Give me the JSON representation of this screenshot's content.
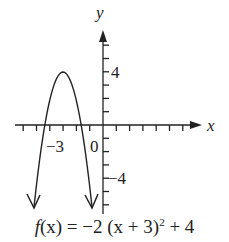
{
  "chart_data": {
    "type": "line",
    "function": "f(x) = -2(x+3)^2 + 4",
    "xlabel": "x",
    "ylabel": "y",
    "tick_labels": {
      "x": [
        "-3",
        "0"
      ],
      "y": [
        "4",
        "-4"
      ]
    },
    "xlim": [
      -7,
      7
    ],
    "ylim": [
      -6,
      7
    ],
    "vertex": [
      -3,
      4
    ],
    "roots": [
      -4.41,
      -1.59
    ],
    "opens": "down",
    "grid": false,
    "legend": null
  },
  "labels": {
    "x_axis": "x",
    "y_axis": "y",
    "tick_neg3": "−3",
    "tick_0": "0",
    "tick_4": "4",
    "tick_neg4": "−4",
    "caption_fx": "f",
    "caption_rest": "(x) = −2 (x + 3)",
    "caption_exp": "2",
    "caption_tail": " + 4"
  }
}
